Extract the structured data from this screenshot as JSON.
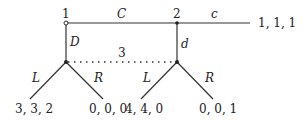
{
  "diagram": {
    "type": "extensive-form game tree",
    "nodes": {
      "player1": {
        "label": "1"
      },
      "player2": {
        "label": "2"
      },
      "player3_info_set": {
        "label": "3"
      }
    },
    "actions": {
      "p1_continue": "C",
      "p1_down": "D",
      "p2_continue": "c",
      "p2_down": "d",
      "p3_left_a": "L",
      "p3_right_a": "R",
      "p3_left_b": "L",
      "p3_right_b": "R"
    },
    "payoffs": {
      "after_C_c": "1, 1, 1",
      "D_L": "3, 3, 2",
      "D_R": "0, 0, 0",
      "C_d_L": "4, 4, 0",
      "C_d_R": "0, 0, 1"
    },
    "colors": {
      "line": "#333333",
      "text": "#222222"
    }
  }
}
